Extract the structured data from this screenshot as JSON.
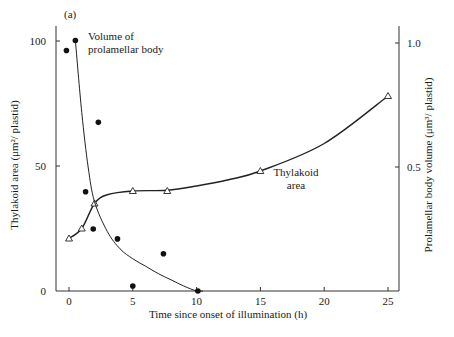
{
  "figure_label": "(a)",
  "chart_data": {
    "type": "line",
    "title": "",
    "panel_label": "(a)",
    "xlabel": "Time since onset of illumination (h)",
    "ylabel_left": "Thylakoid area (μm²/ plastid)",
    "ylabel_right": "Prolamellar body volume (μm³/ plastid)",
    "xlim": [
      -1,
      26
    ],
    "ylim_left": [
      0,
      110
    ],
    "ylim_right": [
      0,
      1.1
    ],
    "x_ticks": [
      0,
      5,
      10,
      15,
      20,
      25
    ],
    "x_tick_labels": [
      "0",
      "5",
      "10",
      "15",
      "20",
      "25"
    ],
    "y_left_ticks": [
      0,
      50,
      100
    ],
    "y_left_tick_labels": [
      "0",
      "50",
      "100"
    ],
    "y_right_ticks": [
      0.5,
      1.0
    ],
    "y_right_tick_labels": [
      "0.5",
      "1.0"
    ],
    "grid": false,
    "legend": "inline annotations",
    "annotations": [
      {
        "text_lines": [
          "Volume of",
          "prolamellar body"
        ],
        "near": "top-left"
      },
      {
        "text_lines": [
          "Thylakoid",
          "area"
        ],
        "near": "x=17, y=45"
      }
    ],
    "series": [
      {
        "name": "Thylakoid area",
        "axis": "left",
        "marker": "open-triangle",
        "points": [
          {
            "x": 0,
            "y": 21
          },
          {
            "x": 1,
            "y": 25
          },
          {
            "x": 2,
            "y": 35
          },
          {
            "x": 5,
            "y": 40
          },
          {
            "x": 7.7,
            "y": 40
          },
          {
            "x": 15,
            "y": 48
          },
          {
            "x": 25,
            "y": 78
          }
        ],
        "curve": [
          [
            0,
            21
          ],
          [
            1,
            25
          ],
          [
            2,
            35
          ],
          [
            3,
            38.5
          ],
          [
            5,
            40
          ],
          [
            7.7,
            40.3
          ],
          [
            10,
            42
          ],
          [
            12.5,
            44.5
          ],
          [
            15,
            48
          ],
          [
            20,
            59
          ],
          [
            25,
            78
          ]
        ]
      },
      {
        "name": "Volume of prolamellar body",
        "axis": "right",
        "marker": "filled-circle",
        "points": [
          {
            "x": -0.2,
            "y": 0.97
          },
          {
            "x": 0.5,
            "y": 1.01
          },
          {
            "x": 1.3,
            "y": 0.4
          },
          {
            "x": 1.9,
            "y": 0.25
          },
          {
            "x": 2.3,
            "y": 0.68
          },
          {
            "x": 3.8,
            "y": 0.21
          },
          {
            "x": 5.0,
            "y": 0.02
          },
          {
            "x": 7.4,
            "y": 0.15
          },
          {
            "x": 10.1,
            "y": 0.0
          }
        ],
        "curve": [
          [
            0.5,
            1.01
          ],
          [
            1.0,
            0.72
          ],
          [
            1.5,
            0.5
          ],
          [
            2,
            0.36
          ],
          [
            3,
            0.24
          ],
          [
            4,
            0.17
          ],
          [
            5,
            0.13
          ],
          [
            6,
            0.1
          ],
          [
            7,
            0.07
          ],
          [
            8,
            0.045
          ],
          [
            9,
            0.02
          ],
          [
            10,
            0.0
          ],
          [
            10.5,
            0.0
          ]
        ]
      }
    ]
  }
}
